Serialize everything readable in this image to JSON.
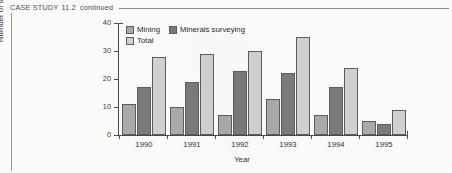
{
  "header": {
    "label": "CASE STUDY",
    "number": "11.2",
    "continued": "continued"
  },
  "chart_data": {
    "type": "bar",
    "title": "",
    "xlabel": "Year",
    "ylabel": "Number of students",
    "categories": [
      "1990",
      "1991",
      "1992",
      "1993",
      "1994",
      "1995"
    ],
    "series": [
      {
        "name": "Mining",
        "color": "#ababab",
        "values": [
          11,
          10,
          7,
          13,
          7,
          5
        ]
      },
      {
        "name": "Minerals surveying",
        "color": "#7b7b7b",
        "values": [
          17,
          19,
          23,
          22,
          17,
          4
        ]
      },
      {
        "name": "Total",
        "color": "#d2d2d2",
        "values": [
          28,
          29,
          30,
          35,
          24,
          9
        ]
      }
    ],
    "ylim": [
      0,
      40
    ],
    "yticks": [
      "0",
      "10",
      "20",
      "30",
      "40"
    ],
    "grid": false,
    "legend_position": "top-left-inside"
  }
}
